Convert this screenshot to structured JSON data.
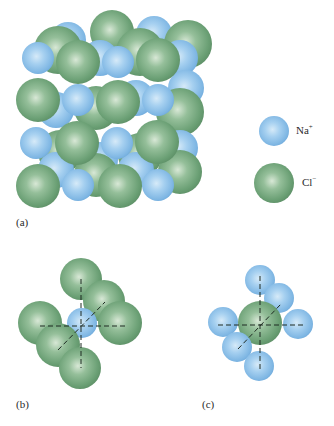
{
  "figure": {
    "panel_a_label": "(a)",
    "panel_b_label": "(b)",
    "panel_c_label": "(c)",
    "legend": [
      {
        "ion": "Na",
        "charge": "+",
        "color": "#8ec3ea"
      },
      {
        "ion": "Cl",
        "charge": "−",
        "color": "#6fa47a"
      }
    ],
    "colors": {
      "sodium": "#8ec3ea",
      "chloride": "#6fa47a",
      "axis_line": "#1e2a22"
    }
  }
}
